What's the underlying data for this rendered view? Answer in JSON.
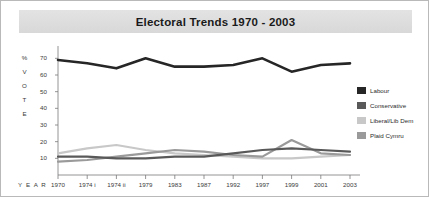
{
  "chart_title": "Electoral Trends 1970 - 2003",
  "axis": {
    "y_label_letters": [
      "%",
      "V",
      "O",
      "T",
      "E"
    ],
    "y_ticks": [
      70,
      60,
      50,
      40,
      30,
      20,
      10
    ],
    "x_label": "Y E A R"
  },
  "legend": {
    "items": [
      {
        "label": "Labour",
        "color": "#262626"
      },
      {
        "label": "Conservative",
        "color": "#595959"
      },
      {
        "label": "Liberal/Lib Dem",
        "color": "#c8c8c8"
      },
      {
        "label": "Plaid Cymru",
        "color": "#9a9a9a"
      }
    ]
  },
  "chart_data": {
    "type": "line",
    "title": "Electoral Trends 1970 - 2003",
    "xlabel": "YEAR",
    "ylabel": "% VOTE",
    "categories": [
      "1970",
      "1974 i",
      "1974 ii",
      "1979",
      "1983",
      "1987",
      "1992",
      "1997",
      "1999",
      "2001",
      "2003"
    ],
    "ylim": [
      0,
      75
    ],
    "yticks": [
      10,
      20,
      30,
      40,
      50,
      60,
      70
    ],
    "grid": false,
    "legend_position": "right",
    "series": [
      {
        "name": "Labour",
        "color": "#262626",
        "values": [
          69,
          67,
          64,
          70,
          65,
          65,
          66,
          70,
          62,
          66,
          67
        ]
      },
      {
        "name": "Conservative",
        "color": "#595959",
        "values": [
          11,
          11,
          10,
          10,
          11,
          11,
          13,
          15,
          16,
          15,
          14
        ]
      },
      {
        "name": "Liberal/Lib Dem",
        "color": "#c8c8c8",
        "values": [
          13,
          16,
          18,
          15,
          13,
          12,
          11,
          10,
          10,
          11,
          12
        ]
      },
      {
        "name": "Plaid Cymru",
        "color": "#9a9a9a",
        "values": [
          8,
          9,
          11,
          13,
          15,
          14,
          12,
          11,
          21,
          13,
          12
        ]
      }
    ]
  }
}
